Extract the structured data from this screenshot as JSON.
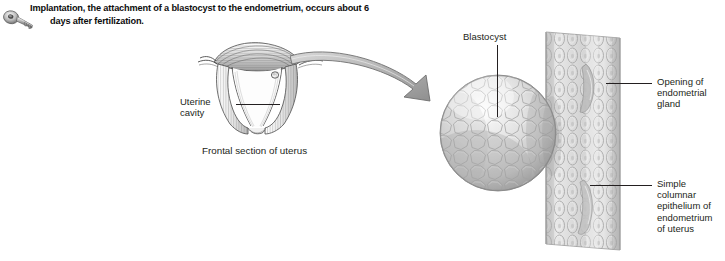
{
  "figure": {
    "key_icon_name": "key-icon",
    "header_line_1": "Implantation, the attachment of a blastocyst to the endometrium, occurs about 6",
    "header_line_2": "days after fertilization."
  },
  "left_diagram": {
    "title": "uterus-frontal-section",
    "caption": "Frontal section of uterus",
    "labels": {
      "uterine_cavity": "Uterine\ncavity"
    }
  },
  "transition": {
    "arrow_name": "magnification-arrow",
    "arrow_color": "#8a8a8a"
  },
  "right_diagram": {
    "title": "blastocyst-implantation-detail",
    "labels": {
      "blastocyst": "Blastocyst",
      "gland_opening": "Opening of\nendometrial\ngland",
      "simple_columnar": "Simple\ncolumnar\nepithelium of\nendometrium\nof uterus"
    }
  },
  "colors": {
    "background": "#ffffff",
    "text": "#231f20",
    "header_text": "#0d0d0d",
    "line_art": "#4d4d4d",
    "tissue_light": "#e3e3e3",
    "tissue_mid": "#c9c9c9",
    "tissue_dark": "#9a9a9a"
  }
}
